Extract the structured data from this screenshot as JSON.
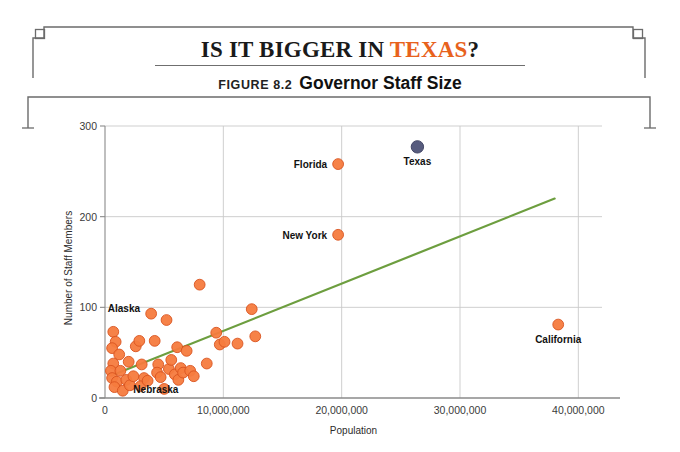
{
  "header": {
    "main_title_prefix": "IS IT BIGGER IN ",
    "main_title_accent": "TEXAS",
    "main_title_suffix": "?",
    "figure_number": "FIGURE 8.2",
    "figure_title": "Governor Staff Size",
    "accent_color": "#E8621C",
    "rule_color": "#6f6f6f",
    "frame_color": "#6b6b6b"
  },
  "chart_data": {
    "type": "scatter",
    "title": "Governor Staff Size",
    "xlabel": "Population",
    "ylabel": "Number of Staff Members",
    "xlim": [
      0,
      42000000
    ],
    "ylim": [
      0,
      300
    ],
    "xticks": [
      0,
      10000000,
      20000000,
      30000000,
      40000000
    ],
    "xtick_labels": [
      "0",
      "10,000,000",
      "20,000,000",
      "30,000,000",
      "40,000,000"
    ],
    "yticks": [
      0,
      100,
      200,
      300
    ],
    "ytick_labels": [
      "0",
      "100",
      "200",
      "300"
    ],
    "grid": true,
    "legend": "none",
    "marker_color": "#F57B3E",
    "marker_edge_color": "#D9541F",
    "highlight_color": "#4E5377",
    "trendline_color": "#6D9E3F",
    "trendline": {
      "x": [
        600000,
        38000000
      ],
      "y": [
        25,
        220
      ]
    },
    "series": [
      {
        "name": "States",
        "color": "#F57B3E",
        "points": [
          {
            "x": 700000,
            "y": 73,
            "label": null
          },
          {
            "x": 900000,
            "y": 62,
            "label": null
          },
          {
            "x": 600000,
            "y": 55,
            "label": null
          },
          {
            "x": 1200000,
            "y": 48,
            "label": null
          },
          {
            "x": 700000,
            "y": 38,
            "label": null
          },
          {
            "x": 500000,
            "y": 30,
            "label": null
          },
          {
            "x": 1300000,
            "y": 30,
            "label": null
          },
          {
            "x": 600000,
            "y": 22,
            "label": null
          },
          {
            "x": 1000000,
            "y": 18,
            "label": null
          },
          {
            "x": 800000,
            "y": 12,
            "label": null
          },
          {
            "x": 1500000,
            "y": 8,
            "label": null
          },
          {
            "x": 1800000,
            "y": 20,
            "label": null
          },
          {
            "x": 2100000,
            "y": 14,
            "label": null
          },
          {
            "x": 2400000,
            "y": 24,
            "label": null
          },
          {
            "x": 2000000,
            "y": 40,
            "label": null
          },
          {
            "x": 2600000,
            "y": 57,
            "label": null
          },
          {
            "x": 2900000,
            "y": 63,
            "label": null
          },
          {
            "x": 3100000,
            "y": 37,
            "label": null
          },
          {
            "x": 3300000,
            "y": 22,
            "label": null
          },
          {
            "x": 3000000,
            "y": 13,
            "label": null
          },
          {
            "x": 3600000,
            "y": 19,
            "label": null
          },
          {
            "x": 3900000,
            "y": 93,
            "label": null
          },
          {
            "x": 4200000,
            "y": 63,
            "label": null
          },
          {
            "x": 4500000,
            "y": 37,
            "label": null
          },
          {
            "x": 4400000,
            "y": 28,
            "label": null
          },
          {
            "x": 4700000,
            "y": 23,
            "label": null
          },
          {
            "x": 5000000,
            "y": 10,
            "label": null
          },
          {
            "x": 5200000,
            "y": 86,
            "label": null
          },
          {
            "x": 5400000,
            "y": 32,
            "label": null
          },
          {
            "x": 5600000,
            "y": 42,
            "label": null
          },
          {
            "x": 5900000,
            "y": 26,
            "label": null
          },
          {
            "x": 6100000,
            "y": 56,
            "label": null
          },
          {
            "x": 6400000,
            "y": 33,
            "label": null
          },
          {
            "x": 6200000,
            "y": 20,
            "label": null
          },
          {
            "x": 6600000,
            "y": 28,
            "label": null
          },
          {
            "x": 6900000,
            "y": 52,
            "label": null
          },
          {
            "x": 7200000,
            "y": 30,
            "label": null
          },
          {
            "x": 7500000,
            "y": 24,
            "label": null
          },
          {
            "x": 8000000,
            "y": 125,
            "label": null
          },
          {
            "x": 8600000,
            "y": 38,
            "label": null
          },
          {
            "x": 9400000,
            "y": 72,
            "label": null
          },
          {
            "x": 9700000,
            "y": 59,
            "label": null
          },
          {
            "x": 10100000,
            "y": 62,
            "label": null
          },
          {
            "x": 11200000,
            "y": 60,
            "label": null
          },
          {
            "x": 12400000,
            "y": 98,
            "label": null
          },
          {
            "x": 12700000,
            "y": 68,
            "label": null
          },
          {
            "x": 19700000,
            "y": 258,
            "label": "Florida",
            "label_side": "left"
          },
          {
            "x": 19700000,
            "y": 180,
            "label": "New York",
            "label_side": "left"
          },
          {
            "x": 38300000,
            "y": 81,
            "label": "California",
            "label_side": "below"
          }
        ]
      },
      {
        "name": "Texas",
        "color": "#4E5377",
        "points": [
          {
            "x": 26400000,
            "y": 277,
            "label": "Texas",
            "label_side": "below"
          }
        ]
      }
    ],
    "cluster_annotations": [
      {
        "text": "Alaska",
        "x": 1600000,
        "y": 95
      },
      {
        "text": "Nebraska",
        "x": 4300000,
        "y": 5
      }
    ]
  }
}
